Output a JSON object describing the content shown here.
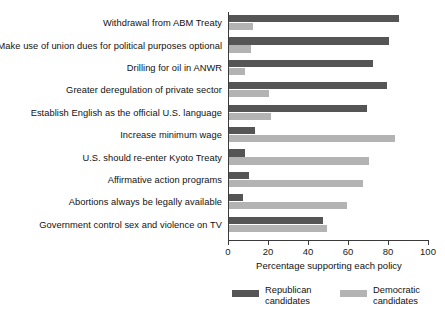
{
  "chart_data": {
    "type": "bar",
    "orientation": "horizontal",
    "title": "",
    "xlabel": "Percentage supporting each policy",
    "ylabel": "",
    "xlim": [
      0,
      100
    ],
    "xticks": [
      0,
      20,
      40,
      60,
      80,
      100
    ],
    "grid": false,
    "legend_position": "bottom",
    "categories": [
      "Withdrawal from ABM Treaty",
      "Make use of union dues for political purposes optional",
      "Drilling for oil in ANWR",
      "Greater deregulation of private sector",
      "Establish English as the official U.S. language",
      "Increase minimum wage",
      "U.S. should re-enter Kyoto Treaty",
      "Affirmative action programs",
      "Abortions always be legally available",
      "Government control sex and violence on TV"
    ],
    "series": [
      {
        "name": "Republican candidates",
        "color": "#555555",
        "values": [
          85,
          80,
          72,
          79,
          69,
          13,
          8,
          10,
          7,
          47
        ]
      },
      {
        "name": "Democratic candidates",
        "color": "#b3b3b3",
        "values": [
          12,
          11,
          8,
          20,
          21,
          83,
          70,
          67,
          59,
          49
        ]
      }
    ]
  },
  "legend": {
    "items": [
      {
        "label_line1": "Republican",
        "label_line2": "candidates"
      },
      {
        "label_line1": "Democratic",
        "label_line2": "candidates"
      }
    ]
  },
  "source_note": ""
}
